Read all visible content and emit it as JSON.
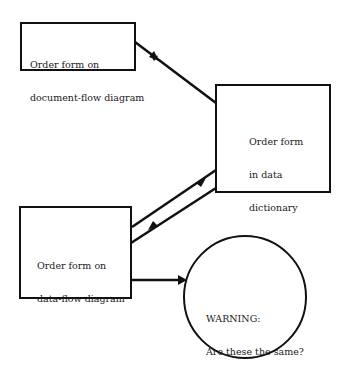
{
  "diagram": {
    "nodes": [
      {
        "id": "doc_flow",
        "shape": "rect",
        "lines": [
          "Order form on",
          "document-flow diagram"
        ]
      },
      {
        "id": "data_dict",
        "shape": "rect",
        "lines": [
          "Order form",
          "in data",
          "dictionary"
        ]
      },
      {
        "id": "data_flow",
        "shape": "rect",
        "lines": [
          "Order form on",
          "data-flow diagram"
        ]
      },
      {
        "id": "warning",
        "shape": "circle",
        "lines": [
          "WARNING:",
          "Are these the same?"
        ]
      }
    ],
    "edges": [
      {
        "from": "doc_flow",
        "to": "data_dict"
      },
      {
        "from": "data_dict",
        "to": "data_flow"
      },
      {
        "from": "data_flow",
        "to": "data_dict"
      },
      {
        "from": "data_flow",
        "to": "warning"
      }
    ],
    "colors": {
      "stroke": "#111111",
      "background": "#ffffff"
    }
  }
}
